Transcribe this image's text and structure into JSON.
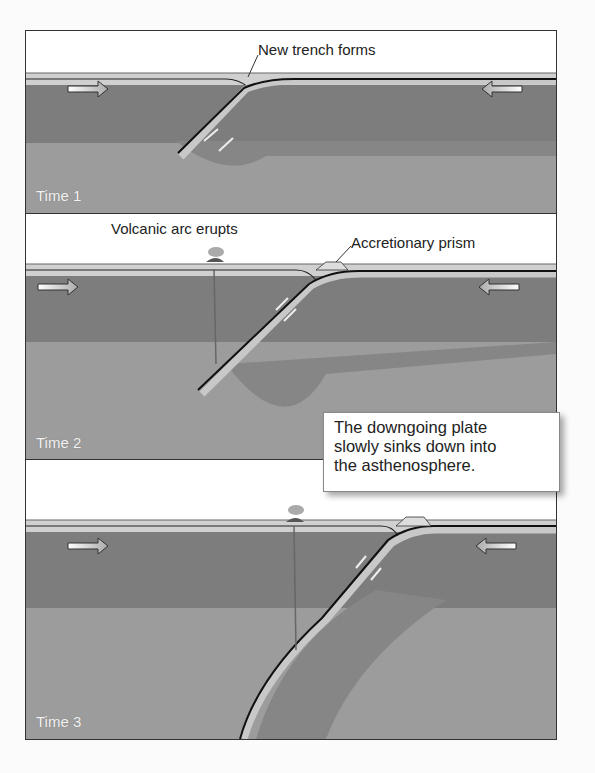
{
  "figure": {
    "panels": [
      {
        "time_label": "Time 1",
        "annotations": [
          "New trench forms"
        ]
      },
      {
        "time_label": "Time 2",
        "annotations": [
          "Volcanic arc erupts",
          "Accretionary prism"
        ]
      },
      {
        "time_label": "Time 3",
        "annotations": []
      }
    ],
    "callout": {
      "line1": "The downgoing plate",
      "line2": "slowly sinks down into",
      "line3": "the asthenosphere."
    },
    "icons": [
      "arrow-right-icon",
      "arrow-left-icon",
      "slip-arrow-up-icon",
      "slip-arrow-down-icon",
      "volcano-plume-icon"
    ],
    "colors": {
      "lithosphere": "#7c7c7c",
      "asthenosphere": "#9a9a9a",
      "plate_edge": "#c9c9c9",
      "fault_line": "#111111",
      "sky": "#ffffff"
    }
  }
}
